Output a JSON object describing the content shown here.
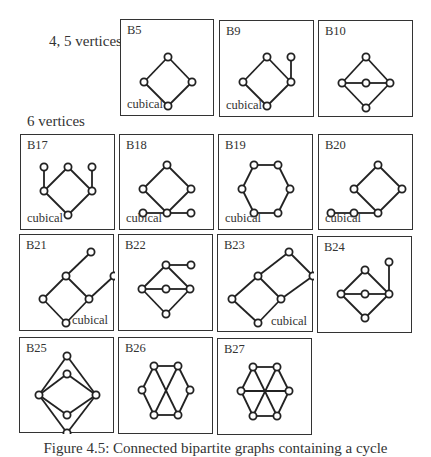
{
  "figure": {
    "labels": {
      "group_45": "4, 5 vertices",
      "group_6": "6 vertices"
    },
    "caption": "Figure 4.5: Connected bipartite graphs containing a cycle"
  },
  "graphs": [
    {
      "id": "B5",
      "note": "cubical",
      "note_pos": "bl",
      "box": [
        120,
        19,
        94,
        97
      ],
      "vertices": [
        [
          47,
          37
        ],
        [
          23,
          62
        ],
        [
          71,
          62
        ],
        [
          47,
          86
        ]
      ],
      "edges": [
        [
          0,
          1
        ],
        [
          0,
          2
        ],
        [
          1,
          3
        ],
        [
          2,
          3
        ]
      ]
    },
    {
      "id": "B9",
      "note": "cubical",
      "note_pos": "bl",
      "box": [
        219,
        20,
        95,
        97
      ],
      "vertices": [
        [
          47,
          36
        ],
        [
          23,
          61
        ],
        [
          71,
          61
        ],
        [
          47,
          85
        ],
        [
          71,
          36
        ]
      ],
      "edges": [
        [
          0,
          1
        ],
        [
          0,
          2
        ],
        [
          1,
          3
        ],
        [
          2,
          3
        ],
        [
          2,
          4
        ]
      ]
    },
    {
      "id": "B10",
      "note": "",
      "note_pos": "bl",
      "box": [
        318,
        20,
        95,
        97
      ],
      "vertices": [
        [
          47,
          36
        ],
        [
          23,
          62
        ],
        [
          47,
          62
        ],
        [
          71,
          62
        ],
        [
          47,
          87
        ]
      ],
      "edges": [
        [
          0,
          1
        ],
        [
          0,
          3
        ],
        [
          1,
          4
        ],
        [
          3,
          4
        ],
        [
          1,
          2
        ],
        [
          2,
          3
        ]
      ]
    },
    {
      "id": "B17",
      "note": "cubical",
      "note_pos": "bl",
      "box": [
        20,
        134,
        95,
        96
      ],
      "vertices": [
        [
          23,
          32
        ],
        [
          47,
          32
        ],
        [
          71,
          32
        ],
        [
          23,
          56
        ],
        [
          71,
          56
        ],
        [
          47,
          80
        ]
      ],
      "edges": [
        [
          1,
          3
        ],
        [
          1,
          4
        ],
        [
          3,
          5
        ],
        [
          4,
          5
        ],
        [
          0,
          3
        ],
        [
          2,
          4
        ]
      ]
    },
    {
      "id": "B18",
      "note": "cubical",
      "note_pos": "bl",
      "box": [
        119,
        134,
        95,
        96
      ],
      "vertices": [
        [
          47,
          30
        ],
        [
          23,
          54
        ],
        [
          71,
          54
        ],
        [
          23,
          78
        ],
        [
          47,
          78
        ],
        [
          71,
          78
        ]
      ],
      "edges": [
        [
          0,
          1
        ],
        [
          0,
          2
        ],
        [
          1,
          4
        ],
        [
          2,
          4
        ],
        [
          3,
          4
        ],
        [
          4,
          5
        ]
      ]
    },
    {
      "id": "B19",
      "note": "cubical",
      "note_pos": "bl",
      "box": [
        218,
        134,
        95,
        96
      ],
      "vertices": [
        [
          35,
          30
        ],
        [
          59,
          30
        ],
        [
          23,
          54
        ],
        [
          71,
          54
        ],
        [
          35,
          78
        ],
        [
          59,
          78
        ]
      ],
      "edges": [
        [
          0,
          1
        ],
        [
          0,
          2
        ],
        [
          1,
          3
        ],
        [
          2,
          4
        ],
        [
          3,
          5
        ],
        [
          4,
          5
        ]
      ]
    },
    {
      "id": "B20",
      "note": "cubical",
      "note_pos": "bl",
      "box": [
        318,
        134,
        95,
        96
      ],
      "vertices": [
        [
          59,
          30
        ],
        [
          35,
          54
        ],
        [
          83,
          54
        ],
        [
          59,
          78
        ],
        [
          35,
          78
        ],
        [
          12,
          78
        ]
      ],
      "edges": [
        [
          0,
          1
        ],
        [
          0,
          2
        ],
        [
          1,
          3
        ],
        [
          2,
          3
        ],
        [
          3,
          4
        ],
        [
          4,
          5
        ]
      ]
    },
    {
      "id": "B21",
      "note": "cubical",
      "note_pos": "br",
      "box": [
        19,
        234,
        95,
        97
      ],
      "vertices": [
        [
          71,
          17
        ],
        [
          46,
          41
        ],
        [
          94,
          41
        ],
        [
          23,
          64
        ],
        [
          69,
          64
        ],
        [
          46,
          88
        ]
      ],
      "edges": [
        [
          0,
          1
        ],
        [
          1,
          3
        ],
        [
          1,
          4
        ],
        [
          3,
          5
        ],
        [
          4,
          5
        ],
        [
          4,
          2
        ]
      ]
    },
    {
      "id": "B22",
      "note": "",
      "note_pos": "bl",
      "box": [
        118,
        234,
        95,
        97
      ],
      "vertices": [
        [
          47,
          30
        ],
        [
          72,
          30
        ],
        [
          23,
          54
        ],
        [
          47,
          54
        ],
        [
          71,
          54
        ],
        [
          47,
          79
        ]
      ],
      "edges": [
        [
          0,
          1
        ],
        [
          0,
          2
        ],
        [
          0,
          4
        ],
        [
          2,
          5
        ],
        [
          4,
          5
        ],
        [
          2,
          3
        ],
        [
          3,
          4
        ]
      ]
    },
    {
      "id": "B23",
      "note": "cubical",
      "note_pos": "br",
      "box": [
        217,
        234,
        96,
        98
      ],
      "vertices": [
        [
          71,
          17
        ],
        [
          40,
          41
        ],
        [
          95,
          41
        ],
        [
          14,
          64
        ],
        [
          63,
          64
        ],
        [
          40,
          88
        ]
      ],
      "edges": [
        [
          0,
          1
        ],
        [
          0,
          2
        ],
        [
          1,
          3
        ],
        [
          1,
          4
        ],
        [
          2,
          4
        ],
        [
          3,
          5
        ],
        [
          4,
          5
        ]
      ]
    },
    {
      "id": "B24",
      "note": "",
      "note_pos": "bl",
      "box": [
        317,
        236,
        95,
        97
      ],
      "vertices": [
        [
          71,
          25
        ],
        [
          47,
          33
        ],
        [
          23,
          57
        ],
        [
          47,
          57
        ],
        [
          71,
          57
        ],
        [
          47,
          81
        ]
      ],
      "edges": [
        [
          1,
          2
        ],
        [
          1,
          4
        ],
        [
          2,
          5
        ],
        [
          4,
          5
        ],
        [
          2,
          3
        ],
        [
          3,
          4
        ],
        [
          0,
          4
        ]
      ]
    },
    {
      "id": "B25",
      "note": "",
      "note_pos": "bl",
      "box": [
        19,
        337,
        95,
        96
      ],
      "vertices": [
        [
          47,
          18
        ],
        [
          47,
          36
        ],
        [
          19,
          57
        ],
        [
          76,
          57
        ],
        [
          47,
          77
        ],
        [
          47,
          95
        ]
      ],
      "edges": [
        [
          0,
          2
        ],
        [
          0,
          3
        ],
        [
          1,
          2
        ],
        [
          1,
          3
        ],
        [
          4,
          2
        ],
        [
          4,
          3
        ],
        [
          5,
          2
        ],
        [
          5,
          3
        ]
      ]
    },
    {
      "id": "B26",
      "note": "",
      "note_pos": "bl",
      "box": [
        118,
        337,
        95,
        97
      ],
      "vertices": [
        [
          35,
          28
        ],
        [
          59,
          28
        ],
        [
          23,
          52
        ],
        [
          71,
          52
        ],
        [
          35,
          77
        ],
        [
          59,
          77
        ]
      ],
      "edges": [
        [
          0,
          1
        ],
        [
          0,
          2
        ],
        [
          1,
          3
        ],
        [
          2,
          4
        ],
        [
          3,
          5
        ],
        [
          4,
          5
        ],
        [
          0,
          5
        ],
        [
          1,
          4
        ]
      ]
    },
    {
      "id": "B27",
      "note": "",
      "note_pos": "bl",
      "box": [
        217,
        338,
        95,
        97
      ],
      "vertices": [
        [
          35,
          28
        ],
        [
          59,
          28
        ],
        [
          23,
          52
        ],
        [
          71,
          52
        ],
        [
          35,
          77
        ],
        [
          59,
          77
        ]
      ],
      "edges": [
        [
          0,
          1
        ],
        [
          0,
          2
        ],
        [
          1,
          3
        ],
        [
          2,
          4
        ],
        [
          3,
          5
        ],
        [
          4,
          5
        ],
        [
          0,
          5
        ],
        [
          1,
          4
        ],
        [
          2,
          3
        ]
      ]
    }
  ]
}
